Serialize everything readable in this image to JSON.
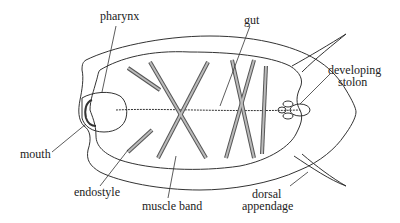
{
  "diagram": {
    "labels": {
      "pharynx": "pharynx",
      "gut": "gut",
      "developing_stolon_line1": "developing",
      "developing_stolon_line2": "stolon",
      "mouth": "mouth",
      "endostyle": "endostyle",
      "muscle_band": "muscle band",
      "dorsal_appendage_line1": "dorsal",
      "dorsal_appendage_line2": "appendage"
    },
    "colors": {
      "line": "#333333",
      "background": "#ffffff",
      "band_fill": "#9a9a9a"
    }
  }
}
